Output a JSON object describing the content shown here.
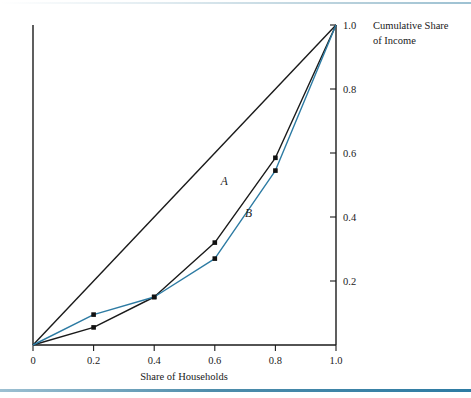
{
  "figure": {
    "background": "#ffffff",
    "rule_color": "#2d7ba3"
  },
  "chart_data": {
    "type": "line",
    "title": "",
    "xlabel": "Share of Households",
    "ylabel": "Cumulative Share of Income",
    "ylabel_lines": [
      "Cumulative Share",
      "of Income"
    ],
    "xlim": [
      0,
      1
    ],
    "ylim": [
      0,
      1
    ],
    "grid": false,
    "legend": "inline-curve-labels",
    "yaxis_position": "right",
    "xticks": [
      0,
      0.2,
      0.4,
      0.6,
      0.8,
      1.0
    ],
    "xtick_labels": [
      "0",
      "0.2",
      "0.4",
      "0.6",
      "0.8",
      "1.0"
    ],
    "yticks": [
      0.2,
      0.4,
      0.6,
      0.8,
      1.0
    ],
    "ytick_labels": [
      "0.2",
      "0.4",
      "0.6",
      "0.8",
      "1.0"
    ],
    "series": [
      {
        "name": "line-of-equality",
        "label": "",
        "color": "#1a1a1a",
        "markers": false,
        "x": [
          0,
          1.0
        ],
        "values": [
          0,
          1.0
        ]
      },
      {
        "name": "A",
        "label": "A",
        "color": "#1a1a1a",
        "markers": true,
        "x": [
          0,
          0.2,
          0.4,
          0.6,
          0.8,
          1.0
        ],
        "values": [
          0,
          0.055,
          0.15,
          0.32,
          0.585,
          1.0
        ],
        "label_point": {
          "x": 0.62,
          "y": 0.5
        }
      },
      {
        "name": "B",
        "label": "B",
        "color": "#2d7ba3",
        "markers": true,
        "x": [
          0,
          0.2,
          0.4,
          0.6,
          0.8,
          1.0
        ],
        "values": [
          0,
          0.095,
          0.15,
          0.27,
          0.545,
          1.0
        ],
        "label_point": {
          "x": 0.7,
          "y": 0.4
        }
      }
    ]
  }
}
